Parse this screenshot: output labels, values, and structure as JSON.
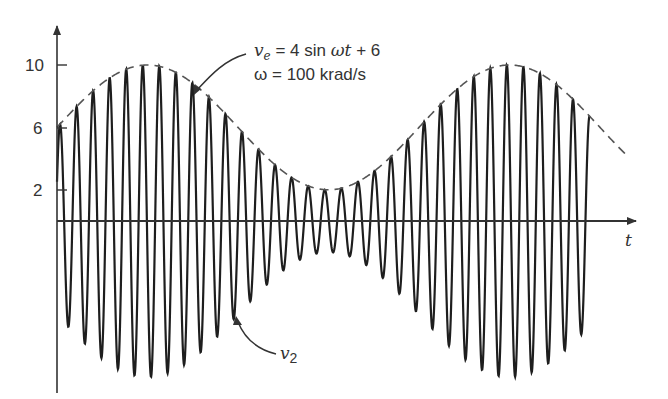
{
  "figure": {
    "y_ticks": [
      {
        "label": "10",
        "value": 10
      },
      {
        "label": "6",
        "value": 6
      },
      {
        "label": "2",
        "value": 2
      }
    ],
    "x_axis_label": "t",
    "envelope_annotation": {
      "line1_var": "v",
      "line1_sub": "e",
      "line1_rest": " = 4 sin ",
      "line1_omega_t": "ωt",
      "line1_tail": " + 6",
      "line2": "ω = 100 krad/s"
    },
    "signal_annotation": {
      "var": "v",
      "sub": "2"
    },
    "colors": {
      "stroke": "#222222",
      "envelope": "#555555",
      "text": "#333333"
    }
  },
  "chart_data": {
    "type": "line",
    "title": "",
    "xlabel": "t",
    "ylabel": "",
    "yticks": [
      2,
      6,
      10
    ],
    "ylim": [
      -10.5,
      11.5
    ],
    "grid": false,
    "series": [
      {
        "name": "v_e = 4 sin ωt + 6 (envelope, dashed)",
        "formula": "4*sin(wt)+6",
        "range": [
          2,
          10
        ],
        "cycles_shown": 1.3
      },
      {
        "name": "v2 (modulated carrier)",
        "formula": "(4*sin(wt)+6)*cos(carrier)",
        "carrier_cycles": 32,
        "peak_max": 10,
        "peak_min": 2
      }
    ],
    "annotations": [
      "v_e = 4 sin ωt + 6",
      "ω = 100 krad/s",
      "v2"
    ]
  }
}
